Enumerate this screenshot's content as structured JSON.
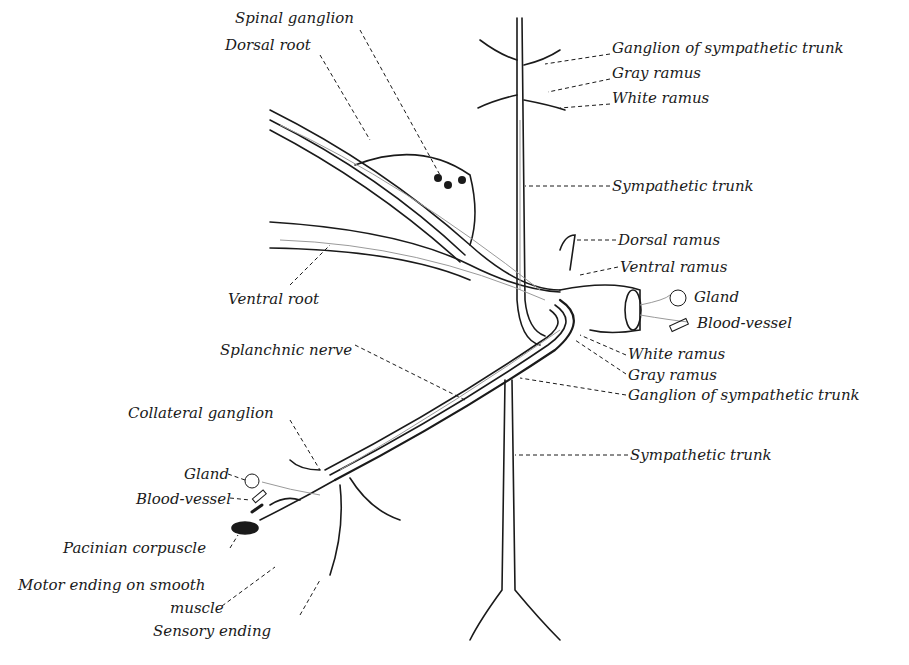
{
  "diagram": {
    "type": "anatomical-illustration",
    "labels": [
      {
        "id": "spinal_ganglion",
        "text": "Spinal ganglion",
        "x": 235,
        "y": 18
      },
      {
        "id": "dorsal_root",
        "text": "Dorsal root",
        "x": 225,
        "y": 45
      },
      {
        "id": "ganglion_symp_top",
        "text": "Ganglion of sympathetic trunk",
        "x": 612,
        "y": 48
      },
      {
        "id": "gray_ramus_top",
        "text": "Gray ramus",
        "x": 612,
        "y": 73
      },
      {
        "id": "white_ramus_top",
        "text": "White ramus",
        "x": 612,
        "y": 98
      },
      {
        "id": "sympathetic_trunk_top",
        "text": "Sympathetic trunk",
        "x": 612,
        "y": 178
      },
      {
        "id": "dorsal_ramus",
        "text": "Dorsal ramus",
        "x": 618,
        "y": 232
      },
      {
        "id": "ventral_ramus",
        "text": "Ventral ramus",
        "x": 620,
        "y": 259
      },
      {
        "id": "ventral_root",
        "text": "Ventral root",
        "x": 228,
        "y": 291
      },
      {
        "id": "gland_right",
        "text": "Gland",
        "x": 694,
        "y": 289
      },
      {
        "id": "blood_vessel_right",
        "text": "Blood-vessel",
        "x": 697,
        "y": 315
      },
      {
        "id": "splanchnic_nerve",
        "text": "Splanchnic nerve",
        "x": 220,
        "y": 342
      },
      {
        "id": "white_ramus_mid",
        "text": "White ramus",
        "x": 628,
        "y": 346
      },
      {
        "id": "gray_ramus_mid",
        "text": "Gray ramus",
        "x": 628,
        "y": 367
      },
      {
        "id": "ganglion_symp_mid",
        "text": "Ganglion of sympathetic trunk",
        "x": 628,
        "y": 387
      },
      {
        "id": "collateral_ganglion",
        "text": "Collateral ganglion",
        "x": 128,
        "y": 405
      },
      {
        "id": "sympathetic_trunk_bottom",
        "text": "Sympathetic trunk",
        "x": 630,
        "y": 447
      },
      {
        "id": "gland_left",
        "text": "Gland",
        "x": 184,
        "y": 466
      },
      {
        "id": "blood_vessel_left",
        "text": "Blood-vessel",
        "x": 136,
        "y": 491
      },
      {
        "id": "pacinian_corpuscle",
        "text": "Pacinian corpuscle",
        "x": 63,
        "y": 540
      },
      {
        "id": "motor_ending_1",
        "text": "Motor ending on smooth",
        "x": 18,
        "y": 577
      },
      {
        "id": "motor_ending_2",
        "text": "muscle",
        "x": 170,
        "y": 600
      },
      {
        "id": "sensory_ending",
        "text": "Sensory ending",
        "x": 153,
        "y": 623
      }
    ],
    "colors": {
      "ink": "#1a1a1a",
      "fiber_gray": "#9a9a9a",
      "background": "#ffffff"
    }
  }
}
